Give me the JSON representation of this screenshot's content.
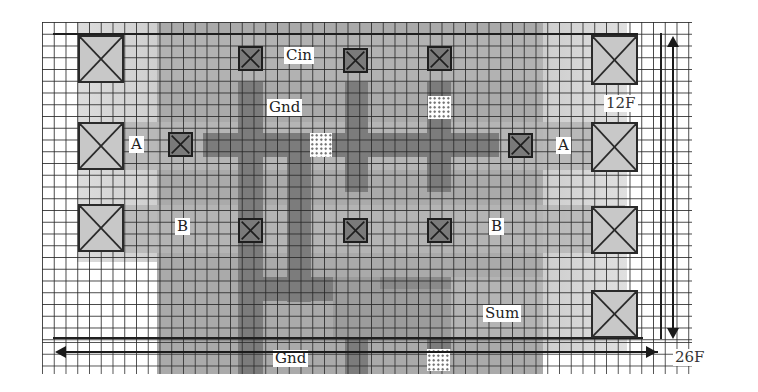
{
  "diagram": {
    "type": "VLSI full-adder cell layout on a lambda grid",
    "colors": {
      "background": "#ffffff",
      "grid_line": "#282828",
      "core_fill": "#a9a9a9",
      "halo_fill": "#d2d2d2",
      "metal_fill": "#7c7c7c",
      "metal_light_fill": "#9c9c9c",
      "pad_fill": "#c8c8c8",
      "via_fill": "#7a7a7a"
    },
    "labels": {
      "cin": "Cin",
      "gnd_top": "Gnd",
      "gnd_bottom": "Gnd",
      "a_left": "A",
      "a_right": "A",
      "b_left": "B",
      "b_right": "B",
      "sum": "Sum"
    },
    "dimensions": {
      "height": "12F",
      "width": "26F"
    },
    "pads": [
      {
        "id": "pad-left-1",
        "x": 78,
        "y": 35,
        "w": 46,
        "h": 48
      },
      {
        "id": "pad-left-2",
        "x": 78,
        "y": 122,
        "w": 46,
        "h": 48
      },
      {
        "id": "pad-left-3",
        "x": 78,
        "y": 204,
        "w": 46,
        "h": 48
      },
      {
        "id": "pad-right-1",
        "x": 591,
        "y": 35,
        "w": 47,
        "h": 50
      },
      {
        "id": "pad-right-2",
        "x": 591,
        "y": 122,
        "w": 47,
        "h": 50
      },
      {
        "id": "pad-right-3",
        "x": 591,
        "y": 206,
        "w": 47,
        "h": 48
      },
      {
        "id": "pad-right-4",
        "x": 591,
        "y": 290,
        "w": 47,
        "h": 48
      }
    ],
    "vias": [
      {
        "id": "via-cin-1",
        "x": 238,
        "y": 46,
        "w": 25,
        "h": 25
      },
      {
        "id": "via-cin-2",
        "x": 343,
        "y": 48,
        "w": 25,
        "h": 25
      },
      {
        "id": "via-cin-3",
        "x": 427,
        "y": 46,
        "w": 25,
        "h": 25
      },
      {
        "id": "via-a-left",
        "x": 168,
        "y": 132,
        "w": 25,
        "h": 25
      },
      {
        "id": "via-a-right",
        "x": 508,
        "y": 133,
        "w": 25,
        "h": 25
      },
      {
        "id": "via-b-1",
        "x": 238,
        "y": 218,
        "w": 25,
        "h": 25
      },
      {
        "id": "via-b-2",
        "x": 343,
        "y": 218,
        "w": 25,
        "h": 25
      },
      {
        "id": "via-b-3",
        "x": 427,
        "y": 218,
        "w": 25,
        "h": 25
      }
    ],
    "contacts": [
      {
        "id": "contact-1",
        "x": 310,
        "y": 133,
        "w": 22,
        "h": 24
      },
      {
        "id": "contact-2",
        "x": 428,
        "y": 96,
        "w": 23,
        "h": 23
      },
      {
        "id": "contact-3",
        "x": 427,
        "y": 349,
        "w": 23,
        "h": 22
      }
    ]
  }
}
